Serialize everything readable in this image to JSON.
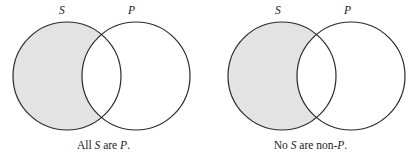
{
  "figure": {
    "type": "venn-diagram-pair",
    "background_color": "#ffffff",
    "stroke_color": "#2b2b2b",
    "shade_color": "#e3e3e3",
    "panels": [
      {
        "id": "all-s-are-p",
        "labels": {
          "left_circle": "S",
          "right_circle": "P"
        },
        "caption": {
          "full_text": "All S are P.",
          "part1": "All ",
          "var1": "S",
          "part2": " are ",
          "var2": "P",
          "part3": "."
        },
        "shaded_region": "S-outside-P",
        "geometry": {
          "left_circle_cx": 67,
          "right_circle_cx": 136,
          "circle_cy": 76,
          "circle_r": 54
        }
      },
      {
        "id": "no-s-are-non-p",
        "labels": {
          "left_circle": "S",
          "right_circle": "P"
        },
        "caption": {
          "full_text": "No S are non-P.",
          "part1": "No ",
          "var1": "S",
          "part2": " are non-",
          "var2": "P",
          "part3": "."
        },
        "shaded_region": "S-outside-P",
        "geometry": {
          "left_circle_cx": 75,
          "right_circle_cx": 144,
          "circle_cy": 76,
          "circle_r": 54
        }
      }
    ]
  }
}
